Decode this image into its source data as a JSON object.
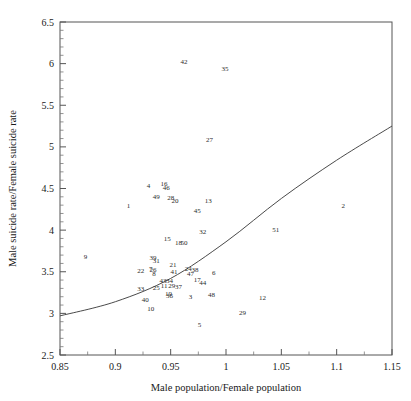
{
  "chart_data": {
    "type": "scatter",
    "title": "",
    "xlabel": "Male population/Female population",
    "ylabel": "Male suicide rate/Female suicide rate",
    "xlim": [
      0.85,
      1.15
    ],
    "ylim": [
      2.5,
      6.5
    ],
    "xticks": [
      "0.85",
      "0.9",
      "0.95",
      "1",
      "1.05",
      "1.1",
      "1.15"
    ],
    "xtick_values": [
      0.85,
      0.9,
      0.95,
      1.0,
      1.05,
      1.1,
      1.15
    ],
    "yticks": [
      "2.5",
      "3",
      "3.5",
      "4",
      "4.5",
      "5",
      "5.5",
      "6",
      "6.5"
    ],
    "ytick_values": [
      2.5,
      3,
      3.5,
      4,
      4.5,
      5,
      5.5,
      6,
      6.5
    ],
    "grid": false,
    "legend": "none",
    "minor_ticks_per_major": 5,
    "marker_style": "numeric-label",
    "points": [
      {
        "label": "42",
        "x": 0.962,
        "y": 6.02
      },
      {
        "label": "35",
        "x": 0.999,
        "y": 5.93
      },
      {
        "label": "27",
        "x": 0.985,
        "y": 5.08
      },
      {
        "label": "4",
        "x": 0.93,
        "y": 4.52
      },
      {
        "label": "16",
        "x": 0.944,
        "y": 4.55
      },
      {
        "label": "46",
        "x": 0.946,
        "y": 4.5
      },
      {
        "label": "49",
        "x": 0.937,
        "y": 4.39
      },
      {
        "label": "28",
        "x": 0.95,
        "y": 4.38
      },
      {
        "label": "20",
        "x": 0.954,
        "y": 4.35
      },
      {
        "label": "1",
        "x": 0.912,
        "y": 4.29
      },
      {
        "label": "13",
        "x": 0.984,
        "y": 4.35
      },
      {
        "label": "2",
        "x": 1.106,
        "y": 4.29
      },
      {
        "label": "45",
        "x": 0.974,
        "y": 4.22
      },
      {
        "label": "32",
        "x": 0.979,
        "y": 3.97
      },
      {
        "label": "51",
        "x": 1.045,
        "y": 4.0
      },
      {
        "label": "15",
        "x": 0.947,
        "y": 3.89
      },
      {
        "label": "18",
        "x": 0.957,
        "y": 3.84
      },
      {
        "label": "50",
        "x": 0.962,
        "y": 3.84
      },
      {
        "label": "9",
        "x": 0.873,
        "y": 3.67
      },
      {
        "label": "39",
        "x": 0.934,
        "y": 3.66
      },
      {
        "label": "31",
        "x": 0.937,
        "y": 3.62
      },
      {
        "label": "21",
        "x": 0.952,
        "y": 3.58
      },
      {
        "label": "7",
        "x": 0.932,
        "y": 3.53
      },
      {
        "label": "26",
        "x": 0.934,
        "y": 3.52
      },
      {
        "label": "22",
        "x": 0.923,
        "y": 3.5
      },
      {
        "label": "24",
        "x": 0.966,
        "y": 3.53
      },
      {
        "label": "38",
        "x": 0.972,
        "y": 3.52
      },
      {
        "label": "41",
        "x": 0.953,
        "y": 3.49
      },
      {
        "label": "8",
        "x": 0.935,
        "y": 3.47
      },
      {
        "label": "47",
        "x": 0.968,
        "y": 3.47
      },
      {
        "label": "6",
        "x": 0.989,
        "y": 3.48
      },
      {
        "label": "43",
        "x": 0.943,
        "y": 3.39
      },
      {
        "label": "34",
        "x": 0.949,
        "y": 3.39
      },
      {
        "label": "17",
        "x": 0.974,
        "y": 3.4
      },
      {
        "label": "44",
        "x": 0.979,
        "y": 3.36
      },
      {
        "label": "33",
        "x": 0.923,
        "y": 3.29
      },
      {
        "label": "11",
        "x": 0.944,
        "y": 3.32
      },
      {
        "label": "29b",
        "x": 0.951,
        "y": 3.33
      },
      {
        "label": "37",
        "x": 0.957,
        "y": 3.31
      },
      {
        "label": "25",
        "x": 0.937,
        "y": 3.3
      },
      {
        "label": "19",
        "x": 0.948,
        "y": 3.23
      },
      {
        "label": "36",
        "x": 0.949,
        "y": 3.2
      },
      {
        "label": "40",
        "x": 0.927,
        "y": 3.16
      },
      {
        "label": "3",
        "x": 0.968,
        "y": 3.19
      },
      {
        "label": "48",
        "x": 0.987,
        "y": 3.21
      },
      {
        "label": "12",
        "x": 1.033,
        "y": 3.18
      },
      {
        "label": "10",
        "x": 0.932,
        "y": 3.05
      },
      {
        "label": "29",
        "x": 1.015,
        "y": 3.0
      },
      {
        "label": "5",
        "x": 0.976,
        "y": 2.85
      }
    ],
    "fit_curve": {
      "description": "smooth increasing fitted line",
      "points": [
        {
          "x": 0.85,
          "y": 2.97
        },
        {
          "x": 0.9,
          "y": 3.14
        },
        {
          "x": 0.95,
          "y": 3.42
        },
        {
          "x": 1.0,
          "y": 3.86
        },
        {
          "x": 1.05,
          "y": 4.38
        },
        {
          "x": 1.1,
          "y": 4.84
        },
        {
          "x": 1.15,
          "y": 5.25
        }
      ]
    }
  }
}
